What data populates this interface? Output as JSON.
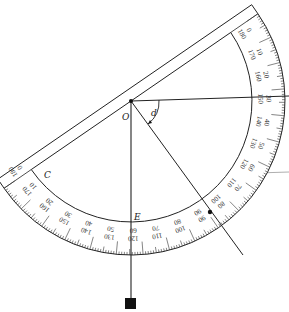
{
  "figure": {
    "type": "protractor-clinometer",
    "labels": {
      "center": "O",
      "angle": "d",
      "left_point": "C",
      "bottom_point": "E"
    },
    "outer_scale": [
      0,
      10,
      20,
      30,
      40,
      50,
      60,
      70,
      80,
      90,
      100,
      110,
      120,
      130,
      140,
      150,
      160,
      170,
      180
    ],
    "inner_scale": [
      180,
      170,
      160,
      150,
      140,
      130,
      120,
      110,
      100,
      90,
      80,
      70,
      60,
      50,
      40,
      30,
      20,
      10,
      0
    ],
    "colors": {
      "ink": "#222222",
      "reference_line": "#999999",
      "background": "#ffffff"
    },
    "elements": [
      "protractor",
      "sight-line",
      "plumb-line",
      "plumb-bob",
      "angle-arc",
      "horizontal-reference-line"
    ]
  }
}
